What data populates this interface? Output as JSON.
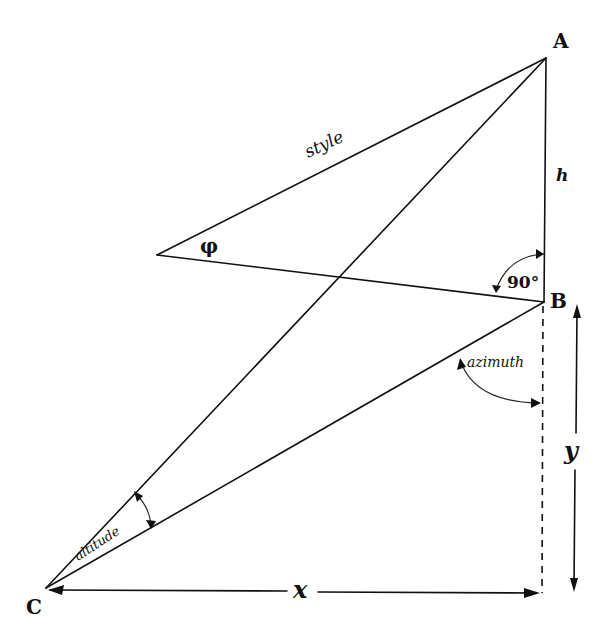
{
  "diagram": {
    "colors": {
      "ink": "#111111",
      "background": "#ffffff"
    },
    "points": {
      "A": {
        "label": "A",
        "x": 546,
        "y": 58
      },
      "B": {
        "label": "B",
        "x": 544,
        "y": 302
      },
      "C": {
        "label": "C",
        "x": 46,
        "y": 588
      },
      "style_tip": {
        "x": 157,
        "y": 255
      },
      "foot": {
        "x": 542,
        "y": 593
      }
    },
    "labels": {
      "style": "style",
      "phi": "φ",
      "h": "h",
      "right_angle": "90°",
      "azimuth": "azimuth",
      "altitude": "altitude",
      "x": "x",
      "y": "y"
    },
    "edges": [
      {
        "from": "A",
        "to": "style_tip",
        "name": "style",
        "style": "solid"
      },
      {
        "from": "style_tip",
        "to": "B",
        "name": "style-base",
        "style": "solid"
      },
      {
        "from": "A",
        "to": "B",
        "name": "h",
        "style": "solid"
      },
      {
        "from": "A",
        "to": "C",
        "name": "sun-ray",
        "style": "solid"
      },
      {
        "from": "B",
        "to": "C",
        "name": "shadow",
        "style": "solid"
      },
      {
        "from": "B",
        "to": "foot",
        "name": "meridian",
        "style": "dashed"
      },
      {
        "from": "C",
        "to": "foot",
        "name": "x",
        "style": "dimension"
      }
    ],
    "angles": [
      {
        "name": "phi",
        "vertex": "style_tip"
      },
      {
        "name": "90°",
        "vertex": "B",
        "between": [
          "A",
          "style_tip"
        ]
      },
      {
        "name": "azimuth",
        "vertex": "B",
        "between": [
          "C",
          "foot"
        ]
      },
      {
        "name": "altitude",
        "vertex": "C",
        "between": [
          "A",
          "B"
        ]
      }
    ]
  }
}
